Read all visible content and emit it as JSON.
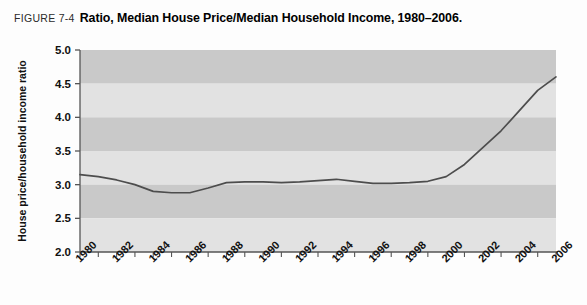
{
  "caption": {
    "figure_number": "FIGURE 7-4",
    "title": "Ratio, Median House Price/Median Household Income, 1980–2006."
  },
  "colors": {
    "page_background": "#fdfdfd",
    "band_dark": "#c9c9c9",
    "band_light": "#e2e2e2",
    "line": "#4d4d4d",
    "axis": "#555555",
    "text": "#111111"
  },
  "chart_data": {
    "type": "line",
    "title": "Ratio, Median House Price/Median Household Income, 1980–2006.",
    "xlabel": "",
    "ylabel": "House price/household income ratio",
    "xlim": [
      1980,
      2006
    ],
    "ylim": [
      2.0,
      5.0
    ],
    "grid": "horizontal-bands",
    "legend": "none",
    "yticks": [
      "2.0",
      "2.5",
      "3.0",
      "3.5",
      "4.0",
      "4.5",
      "5.0"
    ],
    "ytick_values": [
      2.0,
      2.5,
      3.0,
      3.5,
      4.0,
      4.5,
      5.0
    ],
    "xticks": [
      "1980",
      "1982",
      "1984",
      "1986",
      "1988",
      "1990",
      "1992",
      "1994",
      "1996",
      "1998",
      "2000",
      "2002",
      "2004",
      "2006"
    ],
    "xtick_values": [
      1980,
      1982,
      1984,
      1986,
      1988,
      1990,
      1992,
      1994,
      1996,
      1998,
      2000,
      2002,
      2004,
      2006
    ],
    "xtick_minor_step": 1,
    "x": [
      1980,
      1981,
      1982,
      1983,
      1984,
      1985,
      1986,
      1987,
      1988,
      1989,
      1990,
      1991,
      1992,
      1993,
      1994,
      1995,
      1996,
      1997,
      1998,
      1999,
      2000,
      2001,
      2002,
      2003,
      2004,
      2005,
      2006
    ],
    "series": [
      {
        "name": "House price/household income ratio",
        "values": [
          3.15,
          3.12,
          3.07,
          3.0,
          2.9,
          2.88,
          2.88,
          2.95,
          3.03,
          3.04,
          3.04,
          3.03,
          3.04,
          3.06,
          3.08,
          3.05,
          3.02,
          3.02,
          3.03,
          3.05,
          3.12,
          3.3,
          3.55,
          3.8,
          4.1,
          4.4,
          4.6
        ]
      }
    ]
  }
}
